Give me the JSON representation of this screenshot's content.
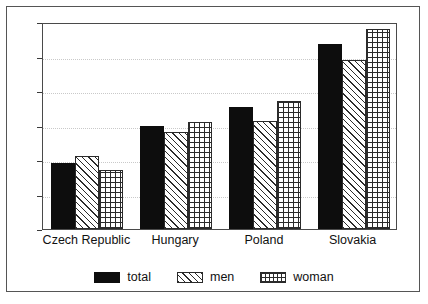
{
  "chart_data": {
    "type": "bar",
    "title": "",
    "subtitle": "",
    "xlabel": "",
    "ylabel": "",
    "categories": [
      "Czech Republic",
      "Hungary",
      "Poland",
      "Slovakia"
    ],
    "series": [
      {
        "name": "total",
        "values": [
          19,
          30,
          35.5,
          53.5
        ],
        "pattern": "solid-black",
        "color": "#0d0d0d"
      },
      {
        "name": "men",
        "values": [
          21.3,
          28,
          31.3,
          49
        ],
        "pattern": "diagonal-hatch",
        "color": "#2b2b2b"
      },
      {
        "name": "woman",
        "values": [
          17,
          31,
          37,
          58
        ],
        "pattern": "crosshatch",
        "color": "#2b2b2b"
      }
    ],
    "ylim": [
      0,
      60
    ],
    "yticks": [
      0,
      10,
      20,
      30,
      40,
      50,
      60
    ],
    "ytick_labels": [
      "0",
      "10",
      "20",
      "30",
      "40",
      "50",
      "60"
    ],
    "grid": true,
    "grid_axis": "y",
    "legend": [
      "total",
      "men",
      "woman"
    ],
    "legend_position": "bottom-center",
    "frame": true,
    "background": "#ffffff"
  }
}
